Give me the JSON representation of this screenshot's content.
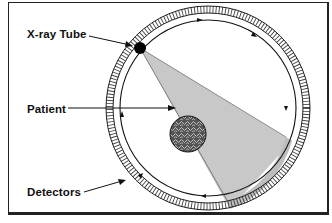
{
  "diagram": {
    "type": "ct-scanner-geometry",
    "labels": {
      "xray_tube": "X-ray Tube",
      "patient": "Patient",
      "detectors": "Detectors"
    },
    "components": [
      {
        "id": "xray_tube",
        "label": "X-ray Tube",
        "shape": "filled-circle",
        "position": "upper-left on rotation path"
      },
      {
        "id": "patient",
        "label": "Patient",
        "shape": "textured-circle",
        "position": "center-right inside ring, within beam"
      },
      {
        "id": "detectors",
        "label": "Detectors",
        "shape": "segmented-ring",
        "position": "outer ring"
      },
      {
        "id": "beam",
        "label": "",
        "shape": "fan",
        "position": "from tube through patient to detector arc"
      },
      {
        "id": "rotation_path",
        "label": "",
        "shape": "circle-with-arrows",
        "direction": "clockwise"
      }
    ],
    "colors": {
      "line": "#111111",
      "beam": "#c8c8c8",
      "background": "#ffffff"
    }
  }
}
